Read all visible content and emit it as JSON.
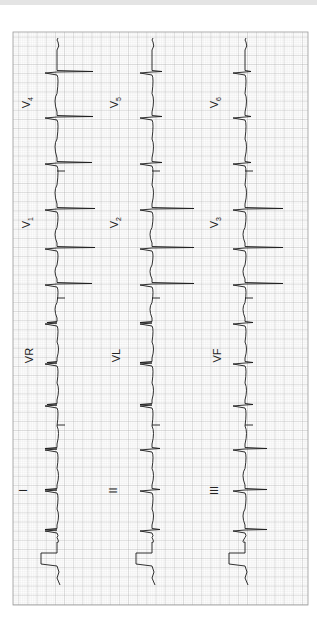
{
  "image": {
    "description": "12-lead electrocardiogram printout, rotated 90 degrees counter-clockwise",
    "paper_color": "#ffffff",
    "grid_minor_color": "#cfcfcf",
    "grid_major_color": "#9a9a9a",
    "trace_color": "#1a1a1a"
  },
  "grid": {
    "x": 13,
    "y": 32,
    "width": 295,
    "height": 573,
    "minor": 1.83,
    "major": 9.15
  },
  "columns": [
    {
      "baseline_x": 57,
      "leads": [
        {
          "name": "I",
          "label": "I",
          "label_x": 28,
          "label_y": 491
        },
        {
          "name": "aVR",
          "label": "VR",
          "label_x": 28,
          "label_y": 356
        },
        {
          "name": "V1",
          "label": "V",
          "sub": "1",
          "label_x": 28,
          "label_y": 222
        },
        {
          "name": "V4",
          "label": "V",
          "sub": "4",
          "label_x": 28,
          "label_y": 102
        }
      ],
      "beats_y": [
        530,
        490,
        449,
        405,
        363,
        323,
        284,
        248,
        209,
        163,
        117,
        72
      ],
      "beat_amp": [
        -12,
        -12,
        -12,
        -10,
        -10,
        -10,
        35,
        38,
        38,
        35,
        36,
        36
      ],
      "dividers_y": [
        425,
        298,
        171
      ]
    },
    {
      "baseline_x": 152,
      "leads": [
        {
          "name": "II",
          "label": "II",
          "label_x": 116,
          "label_y": 491
        },
        {
          "name": "aVL",
          "label": "VL",
          "label_x": 116,
          "label_y": 356
        },
        {
          "name": "V2",
          "label": "V",
          "sub": "2",
          "label_x": 116,
          "label_y": 222
        },
        {
          "name": "V5",
          "label": "V",
          "sub": "5",
          "label_x": 116,
          "label_y": 102
        }
      ],
      "beats_y": [
        530,
        490,
        449,
        405,
        363,
        323,
        284,
        248,
        209,
        163,
        117,
        72
      ],
      "beat_amp": [
        8,
        8,
        8,
        -12,
        -12,
        -12,
        42,
        42,
        42,
        10,
        10,
        10
      ],
      "dividers_y": [
        425,
        298,
        171
      ]
    },
    {
      "baseline_x": 245,
      "leads": [
        {
          "name": "III",
          "label": "III",
          "label_x": 216,
          "label_y": 491
        },
        {
          "name": "aVF",
          "label": "VF",
          "label_x": 216,
          "label_y": 356
        },
        {
          "name": "V3",
          "label": "V",
          "sub": "3",
          "label_x": 216,
          "label_y": 222
        },
        {
          "name": "V6",
          "label": "V",
          "sub": "6",
          "label_x": 216,
          "label_y": 102
        }
      ],
      "beats_y": [
        530,
        490,
        449,
        405,
        363,
        323,
        284,
        248,
        209,
        163,
        117,
        72
      ],
      "beat_amp": [
        22,
        22,
        22,
        8,
        8,
        8,
        38,
        38,
        38,
        6,
        6,
        6
      ],
      "dividers_y": [
        425,
        298,
        171
      ]
    }
  ],
  "calibration": {
    "top_y": 553,
    "bottom_y": 564,
    "width": 16
  }
}
